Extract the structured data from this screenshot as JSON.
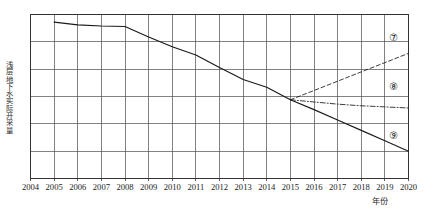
{
  "chart_data": {
    "type": "line",
    "title": "",
    "xlabel": "年份",
    "ylabel": "浅层地下水实际开采量",
    "grid": true,
    "legend_position": "inline-right",
    "xlim": [
      2004,
      2020
    ],
    "ylim": [
      0,
      6
    ],
    "xticks": [
      2004,
      2005,
      2006,
      2007,
      2008,
      2009,
      2010,
      2011,
      2012,
      2013,
      2014,
      2015,
      2016,
      2017,
      2018,
      2019,
      2020
    ],
    "xtick_labels": [
      "2004",
      "2005",
      "2006",
      "2007",
      "2008",
      "2009",
      "2010",
      "2011",
      "2012",
      "2013",
      "2014",
      "2015",
      "2016",
      "2017",
      "2018",
      "2019",
      "2020"
    ],
    "ygridlines": [
      0,
      1,
      2,
      3,
      4,
      5,
      6
    ],
    "ytick_labels": [],
    "series": [
      {
        "name": "历史实际开采量",
        "style": "solid",
        "x": [
          2005,
          2006,
          2007,
          2008,
          2009,
          2010,
          2011,
          2012,
          2013,
          2014,
          2015
        ],
        "values": [
          5.72,
          5.62,
          5.58,
          5.56,
          5.18,
          4.82,
          4.52,
          4.06,
          3.62,
          3.34,
          2.88
        ]
      },
      {
        "name": "情景⑦",
        "style": "dashed",
        "x": [
          2015,
          2016,
          2017,
          2018,
          2019,
          2020
        ],
        "values": [
          2.88,
          3.22,
          3.56,
          3.9,
          4.24,
          4.58
        ]
      },
      {
        "name": "情景⑧",
        "style": "dash-dot",
        "x": [
          2015,
          2016,
          2017,
          2018,
          2019,
          2020
        ],
        "values": [
          2.88,
          2.8,
          2.72,
          2.66,
          2.62,
          2.58
        ]
      },
      {
        "name": "情景⑨",
        "style": "solid",
        "x": [
          2015,
          2016,
          2017,
          2018,
          2019,
          2020
        ],
        "values": [
          2.88,
          2.52,
          2.14,
          1.76,
          1.38,
          1.0
        ]
      }
    ],
    "annotations": [
      {
        "text": "⑦",
        "x": 2019.4,
        "y": 5.15,
        "series": "情景⑦"
      },
      {
        "text": "⑧",
        "x": 2019.4,
        "y": 3.35,
        "series": "情景⑧"
      },
      {
        "text": "⑨",
        "x": 2019.4,
        "y": 1.55,
        "series": "情景⑨"
      }
    ],
    "colors": {
      "line": "#1a1a1a",
      "grid": "#4d4d4d",
      "axis": "#333333",
      "background": "#ffffff"
    }
  }
}
